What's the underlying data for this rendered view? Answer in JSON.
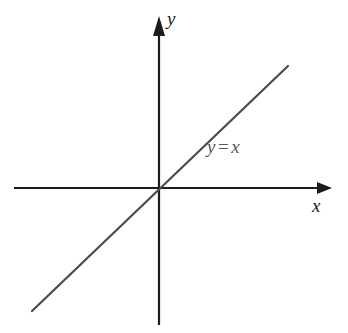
{
  "figure": {
    "title": "",
    "background_color": "#ffffff",
    "width": 348,
    "height": 333
  },
  "axes": {
    "x_axis": {
      "label": "x",
      "icon": "arrow-right-icon",
      "color": "#1c1c1c",
      "origin_y": 188,
      "start_x": 14,
      "end_x": 332
    },
    "y_axis": {
      "label": "y",
      "icon": "arrow-up-icon",
      "color": "#1c1c1c",
      "origin_x": 159,
      "start_y": 17,
      "end_y": 325
    },
    "origin": {
      "x": 159,
      "y": 188
    }
  },
  "annotations": {
    "equation": {
      "lhs": "y",
      "operator": "=",
      "rhs": "x",
      "full": "y = x",
      "color": "#585858"
    }
  },
  "chart_data": {
    "type": "line",
    "title": "",
    "xlabel": "x",
    "ylabel": "y",
    "grid": false,
    "legend": "none",
    "axis_style": "arrow-headed cartesian axes through origin",
    "xlim": [
      -5.1,
      6.1
    ],
    "ylim": [
      -5.1,
      6.1
    ],
    "series": [
      {
        "name": "y = x",
        "equation": "y = x",
        "slope": 1,
        "intercept": 0,
        "color": "#4a4a4a",
        "linewidth": 2,
        "x": [
          -2.66,
          2.69
        ],
        "y": [
          -2.66,
          2.69
        ],
        "endpoints_px": [
          [
            32,
            311
          ],
          [
            288,
            66
          ]
        ],
        "annotation": "y = x"
      }
    ]
  }
}
